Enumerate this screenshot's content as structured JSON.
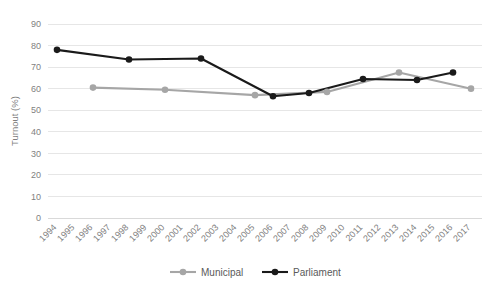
{
  "chart_data": {
    "type": "line",
    "title": "",
    "subtitle": "",
    "xlabel": "",
    "ylabel": "Turnout (%)",
    "ylim": [
      0,
      90
    ],
    "yticks": [
      0,
      10,
      20,
      30,
      40,
      50,
      60,
      70,
      80,
      90
    ],
    "ytick_labels": [
      "0",
      "10",
      "20",
      "30",
      "40",
      "50",
      "60",
      "70",
      "80",
      "90"
    ],
    "grid": true,
    "grid_axis": "y",
    "legend_position": "bottom",
    "categories": [
      "1994",
      "1995",
      "1996",
      "1997",
      "1998",
      "1999",
      "2000",
      "2001",
      "2002",
      "2003",
      "2004",
      "2005",
      "2006",
      "2007",
      "2008",
      "2009",
      "2010",
      "2011",
      "2012",
      "2013",
      "2014",
      "2015",
      "2016",
      "2017"
    ],
    "series": [
      {
        "name": "Municipal",
        "color": "#a6a6a6",
        "marker": "circle",
        "points": [
          {
            "x": "1996",
            "y": 60.5
          },
          {
            "x": "2000",
            "y": 59.5
          },
          {
            "x": "2005",
            "y": 57.0
          },
          {
            "x": "2009",
            "y": 58.5
          },
          {
            "x": "2013",
            "y": 67.5
          },
          {
            "x": "2017",
            "y": 60.0
          }
        ]
      },
      {
        "name": "Parliament",
        "color": "#1a1a1a",
        "marker": "circle",
        "points": [
          {
            "x": "1994",
            "y": 78.0
          },
          {
            "x": "1998",
            "y": 73.5
          },
          {
            "x": "2002",
            "y": 74.0
          },
          {
            "x": "2006",
            "y": 56.5
          },
          {
            "x": "2008",
            "y": 58.0
          },
          {
            "x": "2011",
            "y": 64.5
          },
          {
            "x": "2014",
            "y": 64.0
          },
          {
            "x": "2016",
            "y": 67.5
          }
        ]
      }
    ]
  },
  "legend": {
    "items": [
      {
        "label": "Municipal",
        "color": "#a6a6a6"
      },
      {
        "label": "Parliament",
        "color": "#1a1a1a"
      }
    ]
  },
  "axes": {
    "y_title": "Turnout (%)"
  }
}
